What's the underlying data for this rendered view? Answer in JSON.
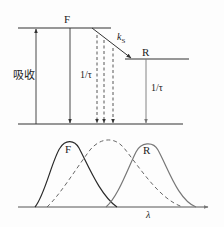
{
  "diagram": {
    "energy_levels": {
      "upper_label": "F",
      "lower_label": "R",
      "absorption_label": "吸收",
      "rate_label_k": "k",
      "rate_label_sub": "S",
      "lifetime_left": "1/τ",
      "lifetime_right": "1/τ"
    },
    "spectra": {
      "curve_F_label": "F",
      "curve_R_label": "R",
      "x_axis_label": "λ"
    },
    "colors": {
      "line": "#333333",
      "curve_F": "#2a2a2a",
      "curve_R": "#777777",
      "dashed": "#666666"
    }
  }
}
